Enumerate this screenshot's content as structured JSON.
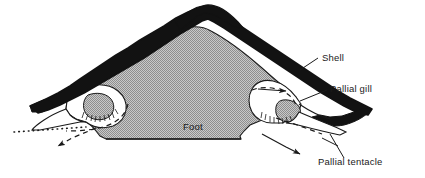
{
  "figure": {
    "type": "biological-cross-section-diagram",
    "background_color": "#ffffff",
    "colors": {
      "shell_black": "#121212",
      "body_gray": "#a9a9a9",
      "body_gray_dark": "#9a9a9a",
      "outline": "#1a1a1a",
      "label_text": "#1a1a1a",
      "white": "#ffffff"
    },
    "labels": [
      {
        "id": "shell",
        "text": "Shell",
        "x": 322,
        "y": 61
      },
      {
        "id": "pallial-gill",
        "text": "Pallial gill",
        "x": 330,
        "y": 92
      },
      {
        "id": "foot",
        "text": "Foot",
        "x": 183,
        "y": 130
      },
      {
        "id": "pallial-tentacle",
        "text": "Pallial tentacle",
        "x": 318,
        "y": 165
      }
    ],
    "flow_markers": {
      "inhalant_dotted_label": "inhalant water flow (dotted)",
      "exhalant_dashed_label": "exhalant water flow (dashed, arrowheads)",
      "arrow_count": 4
    }
  }
}
